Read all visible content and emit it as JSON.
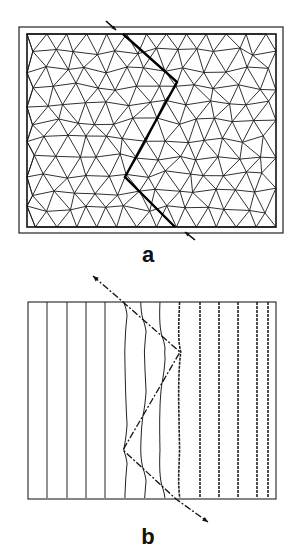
{
  "figure": {
    "panel_a": {
      "label": "a",
      "description": "Triangular finite-element mesh with a zig-zag crack path",
      "outer_frame": [
        19,
        27,
        283,
        233
      ],
      "inner_frame": [
        27,
        34,
        276,
        227
      ],
      "crack_path": [
        [
          123,
          34
        ],
        [
          177,
          82
        ],
        [
          125,
          177
        ],
        [
          175,
          227
        ]
      ],
      "arrow_in": [
        [
          106,
          21
        ],
        [
          116,
          30
        ]
      ],
      "arrow_out": [
        [
          185,
          232
        ],
        [
          195,
          240
        ]
      ]
    },
    "panel_b": {
      "label": "b",
      "description": "Contour lines deflected along the crack path",
      "frame": [
        28,
        302,
        276,
        499
      ],
      "line_x": [
        47,
        67,
        86,
        105,
        124,
        143,
        162,
        181,
        200,
        219,
        238,
        257,
        268
      ],
      "crack_path": [
        [
          93,
          276
        ],
        [
          123,
          302
        ],
        [
          180,
          352
        ],
        [
          123,
          450
        ],
        [
          176,
          499
        ],
        [
          208,
          522
        ]
      ]
    }
  }
}
